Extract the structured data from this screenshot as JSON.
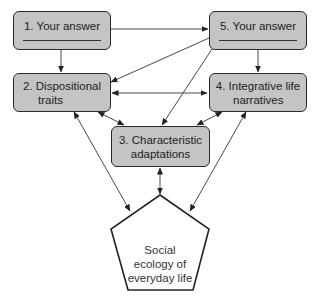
{
  "diagram": {
    "type": "flow-diagram",
    "nodes": [
      {
        "id": "n1",
        "label": "1. Your answer",
        "has_blank": true
      },
      {
        "id": "n2",
        "label": "2. Dispositional traits",
        "line1": "2. Dispositional",
        "line2": "traits"
      },
      {
        "id": "n3",
        "label": "3. Characteristic adaptations",
        "line1": "3. Characteristic",
        "line2": "adaptations"
      },
      {
        "id": "n4",
        "label": "4. Integrative life narratives",
        "line1": "4. Integrative life",
        "line2": "narratives"
      },
      {
        "id": "n5",
        "label": "5. Your answer",
        "has_blank": true
      },
      {
        "id": "social",
        "shape": "pentagon",
        "label": "Social ecology of everyday life",
        "line1": "Social",
        "line2": "ecology of",
        "line3": "everyday life"
      }
    ],
    "edges": [
      {
        "from": "n1",
        "to": "n5",
        "direction": "one-way"
      },
      {
        "from": "n1",
        "to": "n2",
        "direction": "one-way"
      },
      {
        "from": "n5",
        "to": "n4",
        "direction": "one-way"
      },
      {
        "from": "n5",
        "to": "n2",
        "direction": "one-way"
      },
      {
        "from": "n5",
        "to": "n3",
        "direction": "one-way"
      },
      {
        "from": "n2",
        "to": "n4",
        "direction": "two-way"
      },
      {
        "from": "n2",
        "to": "n3",
        "direction": "two-way"
      },
      {
        "from": "n4",
        "to": "n3",
        "direction": "two-way"
      },
      {
        "from": "n3",
        "to": "social",
        "direction": "two-way"
      },
      {
        "from": "n2",
        "to": "social",
        "direction": "two-way"
      },
      {
        "from": "n4",
        "to": "social",
        "direction": "two-way"
      }
    ],
    "colors": {
      "box_fill": "#c4c4c4",
      "box_border": "#2a2a2a",
      "line": "#333333",
      "pentagon_fill": "#ffffff"
    }
  }
}
